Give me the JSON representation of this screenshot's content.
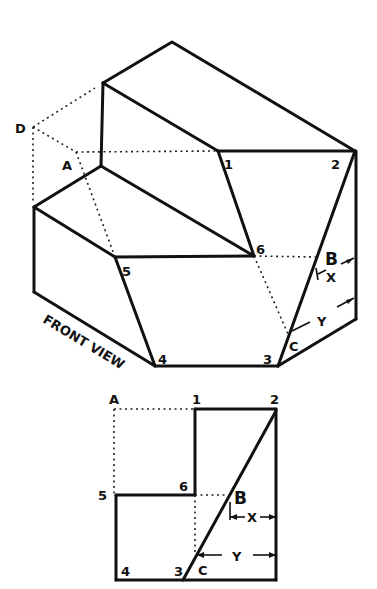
{
  "isometric_view": {
    "labels": {
      "D": "D",
      "A": "A",
      "p1": "1",
      "p2": "2",
      "p3": "3",
      "p4": "4",
      "p5": "5",
      "p6": "6",
      "B": "B",
      "C": "C",
      "X": "X",
      "Y": "Y",
      "front_view": "FRONT VIEW"
    }
  },
  "orthographic_view": {
    "labels": {
      "A": "A",
      "p1": "1",
      "p2": "2",
      "p3": "3",
      "p4": "4",
      "p5": "5",
      "p6": "6",
      "B": "B",
      "C": "C",
      "X": "X",
      "Y": "Y"
    }
  }
}
